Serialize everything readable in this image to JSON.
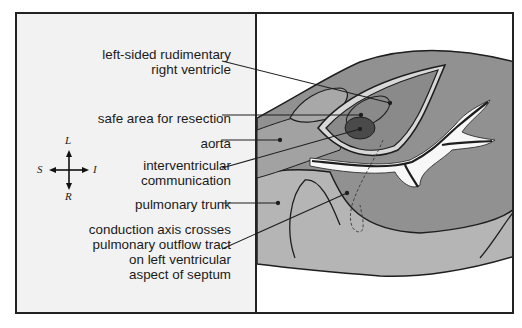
{
  "labels": [
    {
      "id": "rudimentary-rv",
      "text": "left-sided rudimentary\nright ventricle"
    },
    {
      "id": "safe-area",
      "text": "safe area for resection"
    },
    {
      "id": "aorta",
      "text": "aorta"
    },
    {
      "id": "interventricular",
      "text": "interventricular\ncommunication"
    },
    {
      "id": "pulmonary-trunk",
      "text": "pulmonary trunk"
    },
    {
      "id": "conduction-axis",
      "text": "conduction axis crosses\npulmonary outflow tract\non left ventricular\naspect of septum"
    }
  ],
  "compass": {
    "top": "L",
    "bottom": "R",
    "left": "S",
    "right": "I"
  },
  "colors": {
    "panel_bg": "#f2f2f2",
    "outline": "#1e1e1e",
    "tissue_dark": "#8f8f8f",
    "tissue_mid": "#a9a9a9",
    "tissue_light": "#bdbdbd",
    "aorta_spot": "#4a4a4a",
    "fat_white": "#f7f7f7"
  }
}
